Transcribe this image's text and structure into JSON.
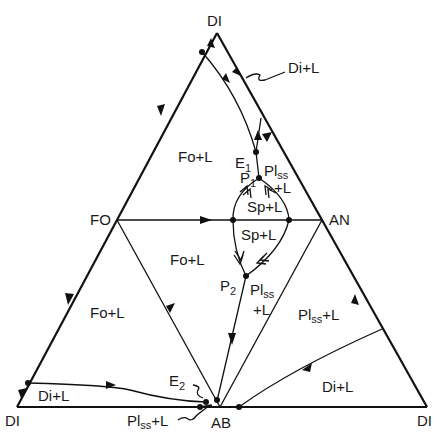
{
  "figure": {
    "type": "ternary-phase-diagram",
    "vertices": {
      "top": "DI",
      "bottom_left": "DI",
      "bottom_right": "DI",
      "left_mid": "FO",
      "right_mid": "AN",
      "bottom_mid": "AB"
    },
    "invariant_points": {
      "e1": "E",
      "e1_sub": "1",
      "e2": "E",
      "e2_sub": "2",
      "p1": "P",
      "p1_sub": "1",
      "p2": "P",
      "p2_sub": "2"
    },
    "fields": {
      "di_l_top": "Di+L",
      "fo_l_upper": "Fo+L",
      "pl_ss_l_upper_main": "Pl",
      "pl_ss_l_upper_sub": "ss",
      "pl_ss_l_upper_line2": "+L",
      "sp_l_upper": "Sp+L",
      "sp_l_lower": "Sp+L",
      "fo_l_middle": "Fo+L",
      "fo_l_left": "Fo+L",
      "pl_ss_l_middle_main": "Pl",
      "pl_ss_l_middle_sub": "ss",
      "pl_ss_l_middle_line2": "+L",
      "pl_ss_l_right_main": "Pl",
      "pl_ss_l_right_sub": "ss",
      "pl_ss_l_right_suffix": "+L",
      "di_l_bottom_left": "Di+L",
      "di_l_bottom_right": "Di+L",
      "pl_ss_l_bottom_main": "Pl",
      "pl_ss_l_bottom_sub": "ss",
      "pl_ss_l_bottom_suffix": "+L"
    }
  }
}
